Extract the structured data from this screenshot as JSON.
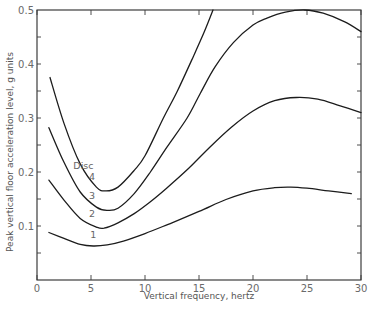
{
  "chart_data": {
    "type": "line",
    "title": "",
    "xlabel": "Vertical frequency, hertz",
    "ylabel": "Peak vertical floor acceleration level, g units",
    "xlim": [
      0,
      30
    ],
    "ylim": [
      0,
      0.5
    ],
    "x_ticks": [
      0,
      5,
      10,
      15,
      20,
      25,
      30
    ],
    "x_tick_labels": [
      "0",
      "5",
      "10",
      "15",
      "20",
      "25",
      "30"
    ],
    "y_ticks": [
      0.1,
      0.2,
      0.3,
      0.4,
      0.5
    ],
    "y_tick_labels": [
      "0.1",
      "0.2",
      "0.3",
      "0.4",
      "0.5"
    ],
    "y_minor_step": 0.05,
    "grid": false,
    "legend_title": "Disc",
    "series": [
      {
        "name": "1",
        "x": [
          1.1,
          2.5,
          4.0,
          5.2,
          6.5,
          8.0,
          10.0,
          12.5,
          15.0,
          17.5,
          20.0,
          22.0,
          23.5,
          25.0,
          27.0,
          29.1
        ],
        "y": [
          0.088,
          0.077,
          0.066,
          0.063,
          0.065,
          0.072,
          0.086,
          0.106,
          0.127,
          0.149,
          0.165,
          0.171,
          0.172,
          0.17,
          0.165,
          0.16
        ]
      },
      {
        "name": "2",
        "x": [
          1.1,
          2.5,
          4.0,
          5.5,
          6.2,
          7.5,
          9.0,
          10.5,
          12.0,
          14.0,
          16.0,
          18.0,
          20.0,
          22.0,
          24.0,
          26.0,
          28.0,
          30.0
        ],
        "y": [
          0.185,
          0.148,
          0.114,
          0.098,
          0.096,
          0.106,
          0.123,
          0.145,
          0.17,
          0.206,
          0.246,
          0.283,
          0.313,
          0.332,
          0.338,
          0.335,
          0.323,
          0.31
        ]
      },
      {
        "name": "3",
        "x": [
          1.1,
          2.5,
          4.0,
          5.5,
          6.5,
          7.5,
          9.0,
          10.5,
          12.0,
          13.9,
          15.1,
          16.5,
          18.2,
          20.0,
          21.3,
          23.0,
          24.8,
          26.5,
          28.5,
          30.0
        ],
        "y": [
          0.282,
          0.218,
          0.163,
          0.135,
          0.129,
          0.133,
          0.16,
          0.2,
          0.245,
          0.3,
          0.345,
          0.395,
          0.44,
          0.472,
          0.485,
          0.496,
          0.5,
          0.494,
          0.478,
          0.46
        ]
      },
      {
        "name": "4",
        "x": [
          1.2,
          2.5,
          4.0,
          5.5,
          6.4,
          7.5,
          9.0,
          10.0,
          11.7,
          13.0,
          14.5,
          15.5,
          16.3
        ],
        "y": [
          0.375,
          0.29,
          0.215,
          0.172,
          0.165,
          0.172,
          0.203,
          0.23,
          0.3,
          0.35,
          0.415,
          0.46,
          0.5
        ]
      }
    ],
    "curve_labels": [
      {
        "text": "Disc",
        "x": 4.3,
        "y": 0.205
      },
      {
        "text": "4",
        "x": 5.1,
        "y": 0.185
      },
      {
        "text": "3",
        "x": 5.1,
        "y": 0.15
      },
      {
        "text": "2",
        "x": 5.1,
        "y": 0.117
      },
      {
        "text": "1",
        "x": 5.2,
        "y": 0.078
      }
    ]
  }
}
